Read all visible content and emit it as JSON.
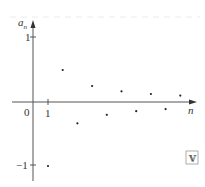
{
  "chart_data": {
    "type": "scatter",
    "title": "",
    "xlabel": "n",
    "ylabel": "a_n",
    "ylabel_main": "a",
    "ylabel_sub": "n",
    "x": [
      1,
      2,
      3,
      4,
      5,
      6,
      7,
      8,
      9,
      10
    ],
    "values": [
      -1,
      0.5,
      -0.333,
      0.25,
      -0.2,
      0.167,
      -0.143,
      0.125,
      -0.111,
      0.1
    ],
    "x_ticks": [
      "1"
    ],
    "y_ticks": [
      "1",
      "-1"
    ],
    "origin_label": "0",
    "ylim": [
      -1.2,
      1.25
    ],
    "xlim": [
      0,
      11
    ],
    "grid": false,
    "legend": null
  },
  "labels": {
    "origin": "0",
    "x_tick_1": "1",
    "y_tick_pos": "1",
    "y_tick_neg": "−1",
    "x_axis": "n",
    "y_axis_main": "a",
    "y_axis_sub": "n"
  },
  "badge": {
    "icon": "double-v-icon",
    "glyph": "V"
  },
  "colors": {
    "axis": "#555555",
    "points": "#222222",
    "dashed": "#e6e6e6"
  }
}
